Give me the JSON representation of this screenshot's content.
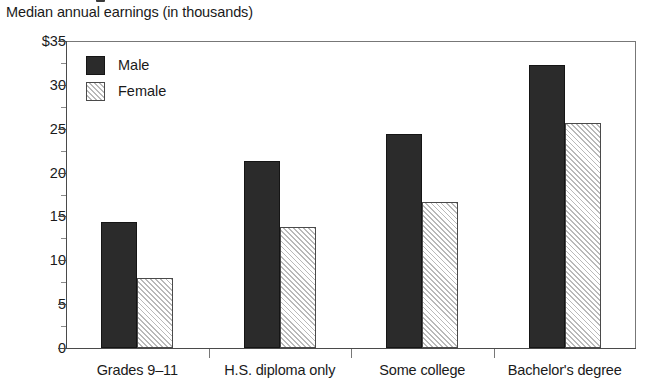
{
  "subtitle": "Median annual earnings (in thousands)",
  "legend": {
    "position": "top-left-inside",
    "entries": [
      {
        "label": "Male",
        "swatch": "solid-dark"
      },
      {
        "label": "Female",
        "swatch": "diagonal-hatch"
      }
    ]
  },
  "axis": {
    "y_tick_labels": [
      "$35",
      "30",
      "25",
      "20",
      "15",
      "10",
      "5",
      "0"
    ],
    "y_tick_values": [
      35,
      30,
      25,
      20,
      15,
      10,
      5,
      0
    ],
    "y_minor_step": 2.5
  },
  "colors": {
    "male_bar": "#2b2b2b",
    "female_bar_fill": "#ffffff",
    "female_bar_hatch": "#b9b9b9",
    "axis": "#4a4a4a",
    "frame": "#777777",
    "text": "#1a1a1a"
  },
  "chart_data": {
    "type": "bar",
    "title": "",
    "subtitle": "Median annual earnings (in thousands)",
    "xlabel": "",
    "ylabel": "",
    "ylim": [
      0,
      35
    ],
    "yticks": [
      0,
      5,
      10,
      15,
      20,
      25,
      30,
      35
    ],
    "ytick_labels": [
      "0",
      "5",
      "10",
      "15",
      "20",
      "25",
      "30",
      "$35"
    ],
    "grid": false,
    "legend_position": "upper left",
    "categories": [
      "Grades 9–11",
      "H.S. diploma only",
      "Some college",
      "Bachelor's degree"
    ],
    "series": [
      {
        "name": "Male",
        "values": [
          14.4,
          21.3,
          24.4,
          32.3
        ]
      },
      {
        "name": "Female",
        "values": [
          8.0,
          13.8,
          16.7,
          25.6
        ]
      }
    ]
  }
}
